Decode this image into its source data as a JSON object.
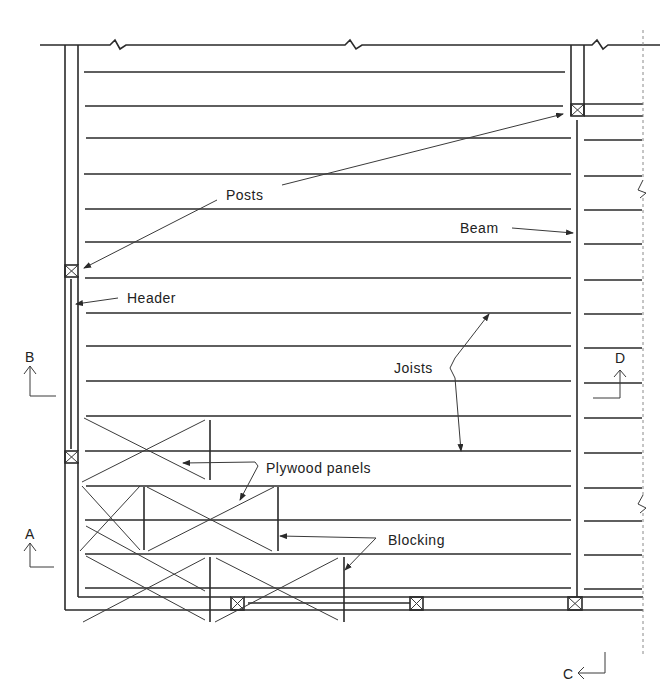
{
  "drawing": {
    "type": "floor framing plan",
    "colors": {
      "ink": "#2a2a2a",
      "background": "#ffffff"
    },
    "labels": {
      "posts": "Posts",
      "header": "Header",
      "beam": "Beam",
      "joists": "Joists",
      "plywood_panels": "Plywood panels",
      "blocking": "Blocking"
    },
    "section_marks": {
      "a": "A",
      "b": "B",
      "c": "C",
      "d": "D"
    },
    "joist_y_positions": [
      72,
      106,
      138,
      174,
      209,
      242,
      278,
      313,
      346,
      381,
      416,
      451,
      486,
      520,
      554,
      588
    ]
  }
}
